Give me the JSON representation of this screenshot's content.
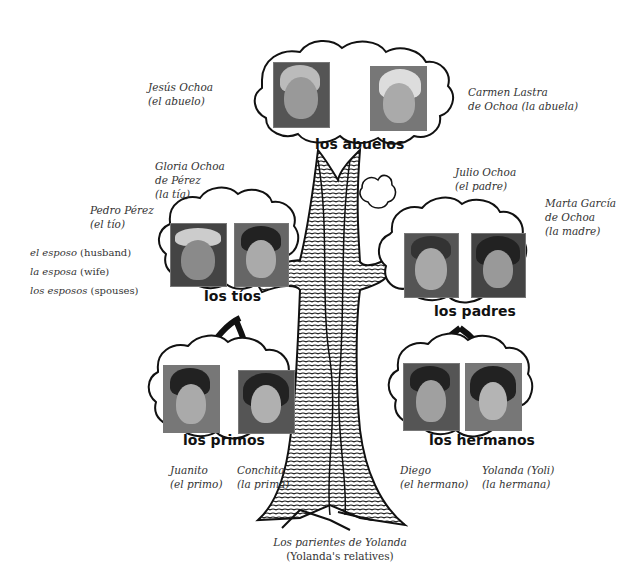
{
  "title": {
    "line1": "Los parientes de Yolanda",
    "line2": "(Yolanda's relatives)"
  },
  "groups": {
    "abuelos": {
      "label": "los abuelos",
      "people": [
        {
          "name": "Jesús Ochoa",
          "relation": "(el abuelo)"
        },
        {
          "name": "Carmen Lastra",
          "relation": "de Ochoa (la abuela)"
        }
      ]
    },
    "tios": {
      "label": "los tíos",
      "people": [
        {
          "name": "Pedro Pérez",
          "relation": "(el tío)"
        },
        {
          "name": "Gloria Ochoa",
          "name2": "de Pérez",
          "relation": "(la tía)"
        }
      ]
    },
    "padres": {
      "label": "los padres",
      "people": [
        {
          "name": "Julio Ochoa",
          "relation": "(el padre)"
        },
        {
          "name": "Marta García",
          "name2": "de Ochoa",
          "relation": "(la madre)"
        }
      ]
    },
    "primos": {
      "label": "los primos",
      "people": [
        {
          "name": "Juanito",
          "relation": "(el primo)"
        },
        {
          "name": "Conchita",
          "relation": "(la prima)"
        }
      ]
    },
    "hermanos": {
      "label": "los hermanos",
      "people": [
        {
          "name": "Diego",
          "relation": "(el hermano)"
        },
        {
          "name": "Yolanda (Yoli)",
          "relation": "(la hermana)"
        }
      ]
    }
  },
  "vocabulary": [
    {
      "term": "el esposo",
      "gloss": "(husband)"
    },
    {
      "term": "la esposa",
      "gloss": "(wife)"
    },
    {
      "term": "los esposos",
      "gloss": "(spouses)"
    }
  ],
  "colors": {
    "ink": "#111111",
    "caption": "#333333",
    "background": "#ffffff"
  }
}
